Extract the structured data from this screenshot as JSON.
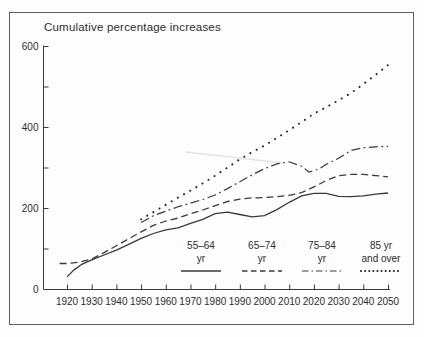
{
  "title": "Cumulative percentage increases",
  "colors": {
    "line": "#3a3a3a",
    "dots": "#222222",
    "text": "#2d2d2d",
    "frame": "#5f5f5f",
    "background": "#fdfdfd",
    "artifact": "#e3e3e3"
  },
  "chart_data": {
    "type": "line",
    "title": "Cumulative percentage increases",
    "xlabel": "",
    "ylabel": "",
    "xlim": [
      1913,
      2053
    ],
    "ylim": [
      0,
      600
    ],
    "grid": false,
    "legend_position": "bottom-inside",
    "x_ticks": [
      1920,
      1930,
      1940,
      1950,
      1960,
      1970,
      1980,
      1990,
      2000,
      2010,
      2020,
      2030,
      2040,
      2050
    ],
    "y_ticks": [
      100,
      200,
      300,
      400,
      500,
      600
    ],
    "y_labeled_ticks": [
      0,
      200,
      400,
      600
    ],
    "series": [
      {
        "name": "55–64 yr",
        "legend_label_line1": "55–64",
        "legend_label_line2": "yr",
        "style": "solid",
        "points": [
          [
            1920,
            30
          ],
          [
            1923,
            48
          ],
          [
            1926,
            61
          ],
          [
            1930,
            72
          ],
          [
            1935,
            84
          ],
          [
            1940,
            96
          ],
          [
            1945,
            110
          ],
          [
            1950,
            125
          ],
          [
            1955,
            137
          ],
          [
            1960,
            146
          ],
          [
            1965,
            151
          ],
          [
            1970,
            162
          ],
          [
            1975,
            172
          ],
          [
            1980,
            186
          ],
          [
            1985,
            190
          ],
          [
            1990,
            184
          ],
          [
            1995,
            178
          ],
          [
            2000,
            181
          ],
          [
            2005,
            196
          ],
          [
            2010,
            214
          ],
          [
            2015,
            230
          ],
          [
            2020,
            236
          ],
          [
            2025,
            236
          ],
          [
            2030,
            229
          ],
          [
            2035,
            228
          ],
          [
            2040,
            230
          ],
          [
            2045,
            234
          ],
          [
            2050,
            237
          ]
        ]
      },
      {
        "name": "65–74 yr",
        "legend_label_line1": "65–74",
        "legend_label_line2": "yr",
        "style": "dashed",
        "points": [
          [
            1917,
            63
          ],
          [
            1920,
            63
          ],
          [
            1925,
            66
          ],
          [
            1930,
            74
          ],
          [
            1935,
            90
          ],
          [
            1940,
            107
          ],
          [
            1945,
            124
          ],
          [
            1950,
            141
          ],
          [
            1955,
            157
          ],
          [
            1960,
            168
          ],
          [
            1965,
            175
          ],
          [
            1970,
            186
          ],
          [
            1975,
            195
          ],
          [
            1980,
            206
          ],
          [
            1985,
            216
          ],
          [
            1990,
            222
          ],
          [
            1995,
            225
          ],
          [
            2000,
            226
          ],
          [
            2005,
            228
          ],
          [
            2010,
            231
          ],
          [
            2015,
            238
          ],
          [
            2020,
            252
          ],
          [
            2025,
            268
          ],
          [
            2030,
            280
          ],
          [
            2035,
            283
          ],
          [
            2040,
            283
          ],
          [
            2045,
            280
          ],
          [
            2050,
            277
          ]
        ]
      },
      {
        "name": "75–84 yr",
        "legend_label_line1": "75–84",
        "legend_label_line2": "yr",
        "style": "dashdot",
        "points": [
          [
            1950,
            164
          ],
          [
            1955,
            181
          ],
          [
            1960,
            192
          ],
          [
            1965,
            203
          ],
          [
            1970,
            212
          ],
          [
            1975,
            221
          ],
          [
            1980,
            232
          ],
          [
            1985,
            248
          ],
          [
            1990,
            265
          ],
          [
            1995,
            282
          ],
          [
            2000,
            297
          ],
          [
            2005,
            309
          ],
          [
            2010,
            314
          ],
          [
            2015,
            303
          ],
          [
            2018,
            289
          ],
          [
            2022,
            296
          ],
          [
            2025,
            308
          ],
          [
            2030,
            323
          ],
          [
            2035,
            342
          ],
          [
            2040,
            349
          ],
          [
            2045,
            351
          ],
          [
            2050,
            352
          ]
        ]
      },
      {
        "name": "85 yr and over",
        "legend_label_line1": "85 yr",
        "legend_label_line2": "and over",
        "style": "dotted",
        "points": [
          [
            1950,
            172
          ],
          [
            1955,
            190
          ],
          [
            1960,
            208
          ],
          [
            1965,
            226
          ],
          [
            1970,
            243
          ],
          [
            1975,
            261
          ],
          [
            1980,
            280
          ],
          [
            1985,
            300
          ],
          [
            1990,
            320
          ],
          [
            1995,
            338
          ],
          [
            2000,
            354
          ],
          [
            2005,
            373
          ],
          [
            2010,
            392
          ],
          [
            2015,
            412
          ],
          [
            2020,
            433
          ],
          [
            2025,
            449
          ],
          [
            2030,
            466
          ],
          [
            2035,
            484
          ],
          [
            2040,
            506
          ],
          [
            2045,
            529
          ],
          [
            2050,
            553
          ]
        ]
      }
    ],
    "scan_artifact": {
      "points": [
        [
          185,
          152
        ],
        [
          231,
          157
        ],
        [
          282,
          163
        ]
      ]
    }
  }
}
